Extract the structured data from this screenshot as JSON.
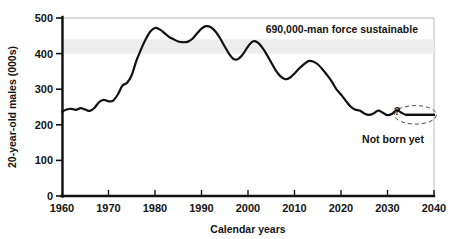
{
  "chart_data": {
    "type": "line",
    "title": "",
    "xlabel": "Calendar years",
    "ylabel": "20-year-old males (000s)",
    "xlim": [
      1960,
      2040
    ],
    "ylim": [
      0,
      500
    ],
    "xticks": [
      "1960",
      "1970",
      "1980",
      "1990",
      "2000",
      "2010",
      "2020",
      "2030",
      "2040"
    ],
    "yticks": [
      "0",
      "100",
      "200",
      "300",
      "400",
      "500"
    ],
    "grid": false,
    "legend": "none",
    "band": {
      "label": "690,000-man force sustainable",
      "y_low": 400,
      "y_high": 440,
      "color": "#ededed"
    },
    "annotations": [
      {
        "name": "sustainable-force-note",
        "text": "690,000-man force sustainable",
        "x": 2022,
        "y": 468
      },
      {
        "name": "question-mark",
        "text": "?",
        "x": 2034,
        "y": 272
      },
      {
        "name": "not-born-yet-note",
        "text": "Not born yet",
        "x": 2030,
        "y": 188
      }
    ],
    "series": [
      {
        "name": "20-year-old males",
        "color": "#111111",
        "x": [
          1960,
          1961,
          1962,
          1963,
          1964,
          1965,
          1966,
          1967,
          1968,
          1969,
          1970,
          1971,
          1972,
          1973,
          1974,
          1975,
          1976,
          1977,
          1978,
          1979,
          1980,
          1981,
          1982,
          1983,
          1984,
          1985,
          1986,
          1987,
          1988,
          1989,
          1990,
          1991,
          1992,
          1993,
          1994,
          1995,
          1996,
          1997,
          1998,
          1999,
          2000,
          2001,
          2002,
          2003,
          2004,
          2005,
          2006,
          2007,
          2008,
          2009,
          2010,
          2011,
          2012,
          2013,
          2014,
          2015,
          2016,
          2017,
          2018,
          2019,
          2020,
          2021,
          2022,
          2023,
          2024,
          2025,
          2026,
          2027,
          2028,
          2029,
          2030,
          2031,
          2032,
          2033,
          2034,
          2035,
          2036,
          2037,
          2038,
          2039,
          2040
        ],
        "y": [
          237,
          243,
          245,
          242,
          247,
          243,
          239,
          248,
          264,
          270,
          266,
          268,
          285,
          310,
          318,
          340,
          380,
          412,
          440,
          462,
          472,
          468,
          458,
          447,
          440,
          434,
          432,
          433,
          441,
          456,
          470,
          477,
          474,
          462,
          443,
          420,
          398,
          384,
          386,
          400,
          420,
          434,
          432,
          418,
          398,
          375,
          352,
          336,
          328,
          332,
          344,
          358,
          370,
          379,
          378,
          370,
          356,
          340,
          322,
          300,
          285,
          268,
          252,
          243,
          240,
          232,
          228,
          232,
          240,
          234,
          227,
          231,
          241,
          234,
          228,
          228,
          228,
          228,
          228,
          228,
          228
        ]
      }
    ],
    "projection": {
      "name": "not-born-yet-projection",
      "x_start": 2034,
      "x_end": 2040,
      "y": 228,
      "ellipse_center_x": 2036,
      "ellipse_center_y": 228,
      "ellipse_rx_years": 4.5,
      "ellipse_ry_units": 26,
      "style": "dashed-ellipse"
    }
  },
  "axes": {
    "y_label": "20-year-old males (000s)",
    "x_label": "Calendar years"
  }
}
